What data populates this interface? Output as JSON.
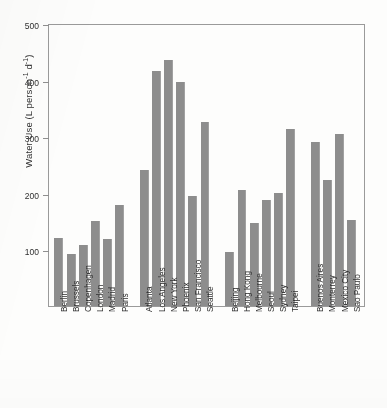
{
  "chart_data": {
    "type": "bar",
    "title": "",
    "xlabel": "",
    "ylabel": "Water Use (L person -1 d -1)",
    "ylabel_parts": {
      "main": "Water Use (L person",
      "sup1": "-1",
      "mid": " d",
      "sup2": "-1",
      "end": ")"
    },
    "ylim": [
      0,
      500
    ],
    "yticks": [
      100,
      200,
      300,
      400,
      500
    ],
    "ytick_labels": [
      "100",
      "200",
      "300",
      "400",
      "500"
    ],
    "grid": false,
    "legend": "none",
    "bar_color": "#8d8d8d",
    "categories": [
      "Berlin",
      "Brussels",
      "Copenhagen",
      "London",
      "Madrid",
      "Paris",
      "Atlanta",
      "Los Angeles",
      "New York",
      "Phoenix",
      "San Francisco",
      "Seattle",
      "Beijing",
      "Hong Kong",
      "Melbourne",
      "Seoul",
      "Sydney",
      "Taipei",
      "Buenos Aires",
      "Monterrey",
      "Mexico City",
      "Sao Paulo"
    ],
    "values": [
      120,
      92,
      107,
      151,
      119,
      178,
      240,
      415,
      435,
      395,
      194,
      325,
      96,
      205,
      146,
      188,
      200,
      312,
      290,
      222,
      304,
      152
    ],
    "groups": [
      {
        "name": "Europe",
        "start": 0,
        "count": 6
      },
      {
        "name": "North America",
        "start": 6,
        "count": 6
      },
      {
        "name": "Asia-Pacific",
        "start": 12,
        "count": 6
      },
      {
        "name": "Latin America",
        "start": 18,
        "count": 4
      }
    ]
  }
}
